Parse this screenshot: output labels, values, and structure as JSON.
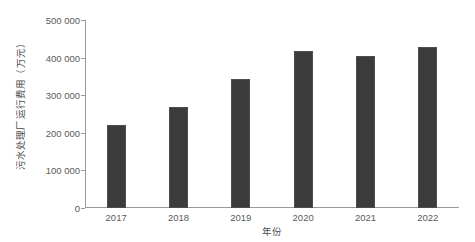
{
  "chart_data": {
    "type": "bar",
    "title": "",
    "subtitle": "",
    "xlabel": "年份",
    "ylabel": "污水处理厂运行费用（万元）",
    "categories": [
      "2017",
      "2018",
      "2019",
      "2020",
      "2021",
      "2022"
    ],
    "values": [
      220000,
      268000,
      343000,
      418000,
      404000,
      428000
    ],
    "series": [
      {
        "name": "污水处理厂运行费用",
        "values": [
          220000,
          268000,
          343000,
          418000,
          404000,
          428000
        ]
      }
    ],
    "ylim": [
      0,
      500000
    ],
    "ytick_values": [
      0,
      100000,
      200000,
      300000,
      400000,
      500000
    ],
    "ytick_labels": [
      "0",
      "100 000",
      "200 000",
      "300 000",
      "400 000",
      "500 000"
    ],
    "xtick_labels": [
      "2017",
      "2018",
      "2019",
      "2020",
      "2021",
      "2022"
    ],
    "grid": false,
    "legend": false,
    "legend_position": "none",
    "bar_color": "#3b3b3b",
    "axis_color": "#9a9a9a",
    "text_color": "#5a5a5a",
    "background_color": "#ffffff"
  },
  "axes": {
    "y_title": "污水处理厂运行费用（万元）",
    "x_title": "年份"
  }
}
